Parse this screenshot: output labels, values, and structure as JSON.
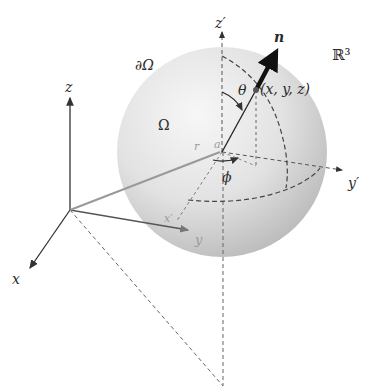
{
  "diagram": {
    "type": "spherical-coordinates-illustration",
    "space_label": "ℝ³",
    "region_label": "Ω",
    "boundary_label": "∂Ω",
    "normal_label": "n",
    "point_label": "(x, y, z)",
    "polar_angle_label": "θ",
    "azimuth_angle_label": "ϕ",
    "center_label": "a",
    "radius_label": "r",
    "global_axes": {
      "x": "x",
      "y": "y",
      "z": "z"
    },
    "local_axes": {
      "y_prime": "y′",
      "z_prime": "z′",
      "x_prime": "x′"
    },
    "colors": {
      "sphere_light": "#f4f4f4",
      "sphere_dark": "#bdbdbd",
      "axis": "#333333",
      "dashed": "#555555",
      "normal_arrow": "#111111"
    }
  }
}
